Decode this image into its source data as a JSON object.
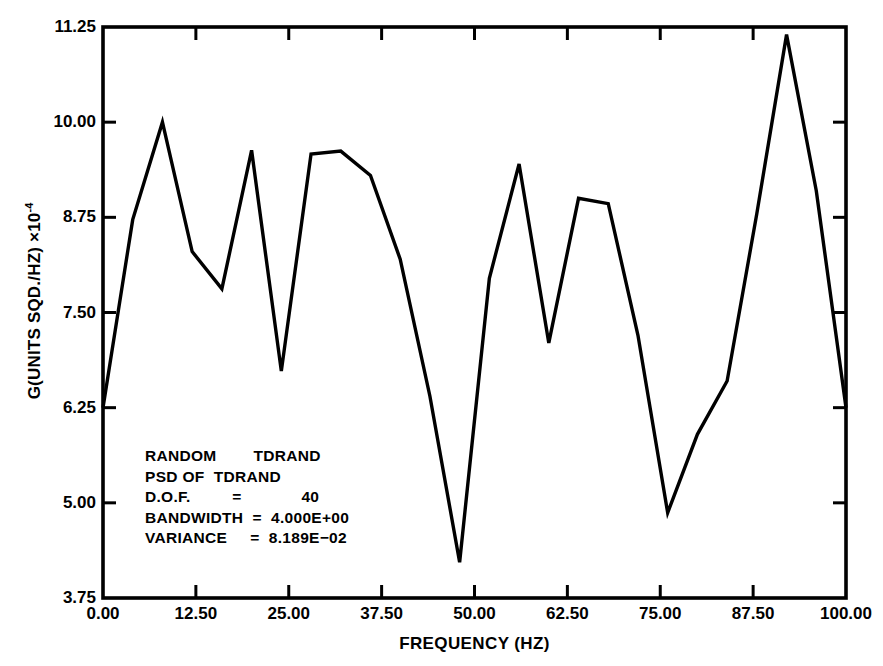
{
  "chart_data": {
    "type": "line",
    "title": "",
    "subtitle": "",
    "xlabel": "FREQUENCY (HZ)",
    "ylabel": "G(UNITS SQD./HZ) ×10",
    "ylabel_exponent": "-4",
    "xlim": [
      0.0,
      100.0
    ],
    "ylim": [
      3.75,
      11.25
    ],
    "xticks": [
      0.0,
      12.5,
      25.0,
      37.5,
      50.0,
      62.5,
      75.0,
      87.5,
      100.0
    ],
    "xtick_labels": [
      "0.00",
      "12.50",
      "25.00",
      "37.50",
      "50.00",
      "62.50",
      "75.00",
      "87.50",
      "100.00"
    ],
    "yticks": [
      3.75,
      5.0,
      6.25,
      7.5,
      8.75,
      10.0,
      11.25
    ],
    "ytick_labels": [
      "3.75",
      "5.00",
      "6.25",
      "7.50",
      "8.75",
      "10.00",
      "11.25"
    ],
    "grid": false,
    "legend": false,
    "line_color": "#000000",
    "line_width": 3.4,
    "series": [
      {
        "name": "PSD OF TDRAND",
        "x": [
          0.0,
          4.0,
          8.0,
          12.0,
          16.0,
          20.0,
          24.0,
          28.0,
          32.0,
          36.0,
          40.0,
          44.0,
          48.0,
          52.0,
          56.0,
          60.0,
          64.0,
          68.0,
          72.0,
          76.0,
          80.0,
          84.0,
          88.0,
          92.0,
          96.0,
          100.0
        ],
        "y": [
          6.25,
          8.72,
          10.0,
          8.3,
          7.81,
          9.63,
          6.73,
          9.58,
          9.62,
          9.3,
          8.2,
          6.4,
          4.22,
          7.95,
          9.45,
          7.1,
          9.0,
          8.93,
          7.2,
          4.87,
          5.9,
          6.6,
          8.8,
          11.15,
          9.1,
          6.25
        ]
      }
    ]
  },
  "annotation": {
    "lines": [
      "RANDOM        TDRAND",
      "PSD OF  TDRAND",
      "D.O.F.         =             40",
      "BANDWIDTH  =  4.000E+00",
      "VARIANCE     =  8.189E−02"
    ]
  },
  "colors": {
    "background": "#ffffff",
    "foreground": "#000000",
    "axis": "#000000"
  }
}
